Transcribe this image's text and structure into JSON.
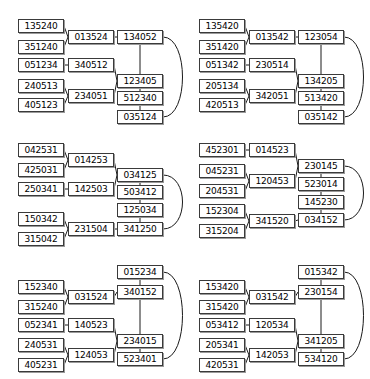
{
  "figure": {
    "panel_count": 6,
    "grid": {
      "columns": 2,
      "rows": 3
    },
    "node_shape": "rectangle",
    "edge_style": "solid-line",
    "colors": {
      "background": "#ffffff",
      "node_fill": "#ffffff",
      "node_border": "#3a3a3a",
      "node_shadow": "#9a9a9a",
      "edge": "#1a1a1a",
      "text": "#000000"
    }
  },
  "panels": [
    {
      "id": "panel-top-left",
      "position": {
        "row": 1,
        "column": 1
      },
      "nodes": [
        {
          "id": "n0",
          "label": "135240",
          "x": 18,
          "y": 19
        },
        {
          "id": "n1",
          "label": "351240",
          "x": 18,
          "y": 40
        },
        {
          "id": "n2",
          "label": "013524",
          "x": 68,
          "y": 30
        },
        {
          "id": "n3",
          "label": "134052",
          "x": 117,
          "y": 30
        },
        {
          "id": "n4",
          "label": "051234",
          "x": 18,
          "y": 58
        },
        {
          "id": "n5",
          "label": "340512",
          "x": 68,
          "y": 58
        },
        {
          "id": "n6",
          "label": "240513",
          "x": 18,
          "y": 79
        },
        {
          "id": "n7",
          "label": "405123",
          "x": 18,
          "y": 98
        },
        {
          "id": "n8",
          "label": "234051",
          "x": 68,
          "y": 89
        },
        {
          "id": "n9",
          "label": "123405",
          "x": 117,
          "y": 74
        },
        {
          "id": "n10",
          "label": "512340",
          "x": 117,
          "y": 91
        },
        {
          "id": "n11",
          "label": "035124",
          "x": 117,
          "y": 110
        }
      ],
      "edges": [
        {
          "from": "n0",
          "to": "n2",
          "type": "line"
        },
        {
          "from": "n1",
          "to": "n2",
          "type": "line"
        },
        {
          "from": "n2",
          "to": "n3",
          "type": "line"
        },
        {
          "from": "n4",
          "to": "n5",
          "type": "line"
        },
        {
          "from": "n5",
          "to": "n9",
          "type": "line"
        },
        {
          "from": "n6",
          "to": "n8",
          "type": "line"
        },
        {
          "from": "n7",
          "to": "n8",
          "type": "line"
        },
        {
          "from": "n8",
          "to": "n9",
          "type": "line"
        },
        {
          "from": "n3",
          "to": "n9",
          "type": "line"
        },
        {
          "from": "n9",
          "to": "n10",
          "type": "line"
        },
        {
          "from": "n10",
          "to": "n11",
          "type": "line"
        },
        {
          "from": "n3",
          "to": "n11",
          "type": "arc"
        }
      ]
    },
    {
      "id": "panel-top-right",
      "position": {
        "row": 1,
        "column": 2
      },
      "nodes": [
        {
          "id": "n0",
          "label": "135420",
          "x": 14,
          "y": 19
        },
        {
          "id": "n1",
          "label": "351420",
          "x": 14,
          "y": 40
        },
        {
          "id": "n2",
          "label": "013542",
          "x": 64,
          "y": 30
        },
        {
          "id": "n3",
          "label": "123054",
          "x": 113,
          "y": 30
        },
        {
          "id": "n4",
          "label": "051342",
          "x": 14,
          "y": 58
        },
        {
          "id": "n5",
          "label": "230514",
          "x": 64,
          "y": 58
        },
        {
          "id": "n6",
          "label": "205134",
          "x": 14,
          "y": 79
        },
        {
          "id": "n7",
          "label": "420513",
          "x": 14,
          "y": 98
        },
        {
          "id": "n8",
          "label": "342051",
          "x": 64,
          "y": 89
        },
        {
          "id": "n9",
          "label": "134205",
          "x": 113,
          "y": 74
        },
        {
          "id": "n10",
          "label": "513420",
          "x": 113,
          "y": 91
        },
        {
          "id": "n11",
          "label": "035142",
          "x": 113,
          "y": 110
        }
      ],
      "edges": [
        {
          "from": "n0",
          "to": "n2",
          "type": "line"
        },
        {
          "from": "n1",
          "to": "n2",
          "type": "line"
        },
        {
          "from": "n2",
          "to": "n3",
          "type": "line"
        },
        {
          "from": "n4",
          "to": "n5",
          "type": "line"
        },
        {
          "from": "n5",
          "to": "n9",
          "type": "line"
        },
        {
          "from": "n6",
          "to": "n8",
          "type": "line"
        },
        {
          "from": "n7",
          "to": "n8",
          "type": "line"
        },
        {
          "from": "n8",
          "to": "n9",
          "type": "line"
        },
        {
          "from": "n3",
          "to": "n9",
          "type": "line"
        },
        {
          "from": "n9",
          "to": "n10",
          "type": "line"
        },
        {
          "from": "n10",
          "to": "n11",
          "type": "line"
        },
        {
          "from": "n3",
          "to": "n11",
          "type": "arc"
        }
      ]
    },
    {
      "id": "panel-middle-left",
      "position": {
        "row": 2,
        "column": 1
      },
      "nodes": [
        {
          "id": "n0",
          "label": "042531",
          "x": 18,
          "y": 17
        },
        {
          "id": "n1",
          "label": "425031",
          "x": 18,
          "y": 37
        },
        {
          "id": "n2",
          "label": "014253",
          "x": 68,
          "y": 27
        },
        {
          "id": "n3",
          "label": "250341",
          "x": 18,
          "y": 56
        },
        {
          "id": "n4",
          "label": "142503",
          "x": 68,
          "y": 56
        },
        {
          "id": "n5",
          "label": "034125",
          "x": 117,
          "y": 42
        },
        {
          "id": "n6",
          "label": "503412",
          "x": 117,
          "y": 59
        },
        {
          "id": "n7",
          "label": "125034",
          "x": 117,
          "y": 77
        },
        {
          "id": "n8",
          "label": "341250",
          "x": 117,
          "y": 96
        },
        {
          "id": "n9",
          "label": "150342",
          "x": 18,
          "y": 86
        },
        {
          "id": "n10",
          "label": "315042",
          "x": 18,
          "y": 106
        },
        {
          "id": "n11",
          "label": "231504",
          "x": 68,
          "y": 96
        }
      ],
      "edges": [
        {
          "from": "n0",
          "to": "n2",
          "type": "line"
        },
        {
          "from": "n1",
          "to": "n2",
          "type": "line"
        },
        {
          "from": "n2",
          "to": "n5",
          "type": "line"
        },
        {
          "from": "n3",
          "to": "n4",
          "type": "line"
        },
        {
          "from": "n4",
          "to": "n5",
          "type": "line"
        },
        {
          "from": "n5",
          "to": "n6",
          "type": "line"
        },
        {
          "from": "n6",
          "to": "n7",
          "type": "line"
        },
        {
          "from": "n7",
          "to": "n8",
          "type": "line"
        },
        {
          "from": "n9",
          "to": "n11",
          "type": "line"
        },
        {
          "from": "n10",
          "to": "n11",
          "type": "line"
        },
        {
          "from": "n11",
          "to": "n8",
          "type": "line"
        },
        {
          "from": "n5",
          "to": "n8",
          "type": "arc"
        }
      ]
    },
    {
      "id": "panel-middle-right",
      "position": {
        "row": 2,
        "column": 2
      },
      "nodes": [
        {
          "id": "n0",
          "label": "452301",
          "x": 14,
          "y": 17
        },
        {
          "id": "n1",
          "label": "014523",
          "x": 64,
          "y": 17
        },
        {
          "id": "n2",
          "label": "045231",
          "x": 14,
          "y": 38
        },
        {
          "id": "n3",
          "label": "204531",
          "x": 14,
          "y": 58
        },
        {
          "id": "n4",
          "label": "120453",
          "x": 64,
          "y": 48
        },
        {
          "id": "n5",
          "label": "230145",
          "x": 113,
          "y": 33
        },
        {
          "id": "n6",
          "label": "523014",
          "x": 113,
          "y": 51
        },
        {
          "id": "n7",
          "label": "145230",
          "x": 113,
          "y": 69
        },
        {
          "id": "n8",
          "label": "034152",
          "x": 113,
          "y": 87
        },
        {
          "id": "n9",
          "label": "152304",
          "x": 14,
          "y": 78
        },
        {
          "id": "n10",
          "label": "315204",
          "x": 14,
          "y": 98
        },
        {
          "id": "n11",
          "label": "341520",
          "x": 64,
          "y": 88
        }
      ],
      "edges": [
        {
          "from": "n0",
          "to": "n1",
          "type": "line"
        },
        {
          "from": "n1",
          "to": "n5",
          "type": "line"
        },
        {
          "from": "n2",
          "to": "n4",
          "type": "line"
        },
        {
          "from": "n3",
          "to": "n4",
          "type": "line"
        },
        {
          "from": "n4",
          "to": "n5",
          "type": "line"
        },
        {
          "from": "n5",
          "to": "n6",
          "type": "line"
        },
        {
          "from": "n6",
          "to": "n7",
          "type": "line"
        },
        {
          "from": "n7",
          "to": "n8",
          "type": "line"
        },
        {
          "from": "n9",
          "to": "n11",
          "type": "line"
        },
        {
          "from": "n10",
          "to": "n11",
          "type": "line"
        },
        {
          "from": "n11",
          "to": "n8",
          "type": "line"
        },
        {
          "from": "n5",
          "to": "n8",
          "type": "arc"
        }
      ]
    },
    {
      "id": "panel-bottom-left",
      "position": {
        "row": 3,
        "column": 1
      },
      "nodes": [
        {
          "id": "n0",
          "label": "015234",
          "x": 117,
          "y": 13
        },
        {
          "id": "n1",
          "label": "152340",
          "x": 18,
          "y": 28
        },
        {
          "id": "n2",
          "label": "315240",
          "x": 18,
          "y": 48
        },
        {
          "id": "n3",
          "label": "031524",
          "x": 68,
          "y": 38
        },
        {
          "id": "n4",
          "label": "340152",
          "x": 117,
          "y": 33
        },
        {
          "id": "n5",
          "label": "052341",
          "x": 18,
          "y": 66
        },
        {
          "id": "n6",
          "label": "140523",
          "x": 68,
          "y": 66
        },
        {
          "id": "n7",
          "label": "240531",
          "x": 18,
          "y": 86
        },
        {
          "id": "n8",
          "label": "405231",
          "x": 18,
          "y": 106
        },
        {
          "id": "n9",
          "label": "124053",
          "x": 68,
          "y": 96
        },
        {
          "id": "n10",
          "label": "234015",
          "x": 117,
          "y": 82
        },
        {
          "id": "n11",
          "label": "523401",
          "x": 117,
          "y": 100
        }
      ],
      "edges": [
        {
          "from": "n1",
          "to": "n3",
          "type": "line"
        },
        {
          "from": "n2",
          "to": "n3",
          "type": "line"
        },
        {
          "from": "n3",
          "to": "n4",
          "type": "line"
        },
        {
          "from": "n0",
          "to": "n4",
          "type": "line"
        },
        {
          "from": "n4",
          "to": "n10",
          "type": "line"
        },
        {
          "from": "n5",
          "to": "n6",
          "type": "line"
        },
        {
          "from": "n6",
          "to": "n10",
          "type": "line"
        },
        {
          "from": "n7",
          "to": "n9",
          "type": "line"
        },
        {
          "from": "n8",
          "to": "n9",
          "type": "line"
        },
        {
          "from": "n9",
          "to": "n10",
          "type": "line"
        },
        {
          "from": "n10",
          "to": "n11",
          "type": "line"
        },
        {
          "from": "n0",
          "to": "n11",
          "type": "arc"
        }
      ]
    },
    {
      "id": "panel-bottom-right",
      "position": {
        "row": 3,
        "column": 2
      },
      "nodes": [
        {
          "id": "n0",
          "label": "015342",
          "x": 113,
          "y": 13
        },
        {
          "id": "n1",
          "label": "153420",
          "x": 14,
          "y": 28
        },
        {
          "id": "n2",
          "label": "315420",
          "x": 14,
          "y": 48
        },
        {
          "id": "n3",
          "label": "031542",
          "x": 64,
          "y": 38
        },
        {
          "id": "n4",
          "label": "230154",
          "x": 113,
          "y": 33
        },
        {
          "id": "n5",
          "label": "053412",
          "x": 14,
          "y": 66
        },
        {
          "id": "n6",
          "label": "120534",
          "x": 64,
          "y": 66
        },
        {
          "id": "n7",
          "label": "205341",
          "x": 14,
          "y": 86
        },
        {
          "id": "n8",
          "label": "420531",
          "x": 14,
          "y": 106
        },
        {
          "id": "n9",
          "label": "142053",
          "x": 64,
          "y": 96
        },
        {
          "id": "n10",
          "label": "341205",
          "x": 113,
          "y": 82
        },
        {
          "id": "n11",
          "label": "534120",
          "x": 113,
          "y": 100
        }
      ],
      "edges": [
        {
          "from": "n1",
          "to": "n3",
          "type": "line"
        },
        {
          "from": "n2",
          "to": "n3",
          "type": "line"
        },
        {
          "from": "n3",
          "to": "n4",
          "type": "line"
        },
        {
          "from": "n0",
          "to": "n4",
          "type": "line"
        },
        {
          "from": "n4",
          "to": "n10",
          "type": "line"
        },
        {
          "from": "n5",
          "to": "n6",
          "type": "line"
        },
        {
          "from": "n6",
          "to": "n10",
          "type": "line"
        },
        {
          "from": "n7",
          "to": "n9",
          "type": "line"
        },
        {
          "from": "n8",
          "to": "n9",
          "type": "line"
        },
        {
          "from": "n9",
          "to": "n10",
          "type": "line"
        },
        {
          "from": "n10",
          "to": "n11",
          "type": "line"
        },
        {
          "from": "n0",
          "to": "n11",
          "type": "arc"
        }
      ]
    }
  ]
}
